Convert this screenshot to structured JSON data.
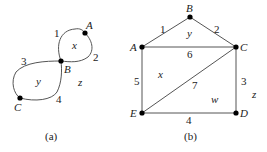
{
  "figure_a": {
    "caption": "(a)",
    "vertices": {
      "A": "A",
      "B": "B",
      "C": "C"
    },
    "edges": {
      "e1": "1",
      "e2": "2",
      "e3": "3",
      "e4": "4"
    },
    "faces": {
      "x": "x",
      "y": "y",
      "z": "z"
    }
  },
  "figure_b": {
    "caption": "(b)",
    "vertices": {
      "A": "A",
      "B": "B",
      "C": "C",
      "D": "D",
      "E": "E"
    },
    "edges": {
      "e1": "1",
      "e2": "2",
      "e3": "3",
      "e4": "4",
      "e5": "5",
      "e6": "6",
      "e7": "7"
    },
    "faces": {
      "x": "x",
      "y": "y",
      "w": "w",
      "z": "z"
    }
  }
}
